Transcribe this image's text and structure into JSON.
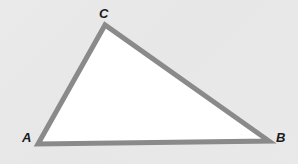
{
  "figure": {
    "type": "geometry-diagram",
    "shape": "triangle",
    "background_color": "#e9e9e9",
    "fill_color": "#ffffff",
    "stroke_color": "#8a8a8a",
    "stroke_width": 5,
    "label_color": "#1a1a1a",
    "vertices": [
      {
        "name": "A",
        "label": "A",
        "x": 38,
        "y": 144,
        "label_x": 22,
        "label_y": 131
      },
      {
        "name": "B",
        "label": "B",
        "x": 269,
        "y": 141,
        "label_x": 276,
        "label_y": 131
      },
      {
        "name": "C",
        "label": "C",
        "x": 105,
        "y": 25,
        "label_x": 99,
        "label_y": 7
      }
    ],
    "edges": [
      {
        "name": "edge-AC",
        "from": "A",
        "to": "C"
      },
      {
        "name": "edge-CB",
        "from": "C",
        "to": "B"
      },
      {
        "name": "edge-BA",
        "from": "B",
        "to": "A"
      }
    ],
    "polygon_points": "38,144 105,25 269,141"
  }
}
